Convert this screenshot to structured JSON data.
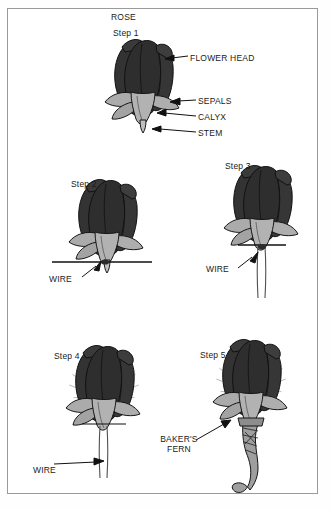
{
  "figure": {
    "title": "ROSE",
    "frame": {
      "border_color": "#9a9a9a",
      "background": "#ffffff"
    },
    "colors": {
      "flower_head": "#333333",
      "flower_head_dark": "#262626",
      "sepals": "#a9a9a9",
      "calyx": "#b3b3b3",
      "stem": "#bdbdbd",
      "outline": "#1a1a1a",
      "fern": "#8c8c8c",
      "ribbon": "#9e9e9e",
      "label_text": "#1a1a1a"
    }
  },
  "steps": [
    {
      "id": "step-1",
      "label": "Step 1",
      "callouts": [
        {
          "id": "flower-head",
          "text": "FLOWER HEAD"
        },
        {
          "id": "sepals",
          "text": "SEPALS"
        },
        {
          "id": "calyx",
          "text": "CALYX"
        },
        {
          "id": "stem",
          "text": "STEM"
        }
      ]
    },
    {
      "id": "step-2",
      "label": "Step 2",
      "callouts": [
        {
          "id": "wire",
          "text": "WIRE"
        }
      ]
    },
    {
      "id": "step-3",
      "label": "Step 3",
      "callouts": [
        {
          "id": "wire",
          "text": "WIRE"
        }
      ]
    },
    {
      "id": "step-4",
      "label": "Step 4",
      "callouts": [
        {
          "id": "wire",
          "text": "WIRE"
        }
      ]
    },
    {
      "id": "step-5",
      "label": "Step 5",
      "callouts": [
        {
          "id": "bakers-fern",
          "text": "BAKER'S\nFERN"
        }
      ]
    }
  ]
}
